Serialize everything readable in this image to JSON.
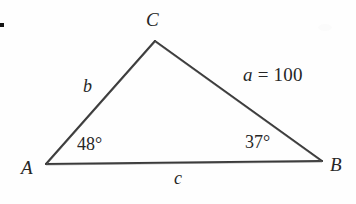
{
  "figure": {
    "type": "geometry-diagram",
    "shape": "triangle",
    "background_color": "#fefefe",
    "stroke_color": "#3a3a3a",
    "text_color": "#262626"
  },
  "vertices": {
    "a": {
      "label": "A",
      "x": 46,
      "y": 164
    },
    "b": {
      "label": "B",
      "x": 322,
      "y": 161
    },
    "c": {
      "label": "C",
      "x": 155,
      "y": 41
    }
  },
  "sides": {
    "a": {
      "label": "a",
      "equals": "=",
      "value": "100",
      "full": "a = 100",
      "between": "C-B"
    },
    "b": {
      "label": "b",
      "value": "",
      "between": "A-C"
    },
    "c": {
      "label": "c",
      "value": "",
      "between": "A-B"
    }
  },
  "angles": {
    "at_a": {
      "label": "48°",
      "degrees": 48
    },
    "at_b": {
      "label": "37°",
      "degrees": 37
    }
  },
  "artifacts": {
    "bullet_dot": "•"
  }
}
